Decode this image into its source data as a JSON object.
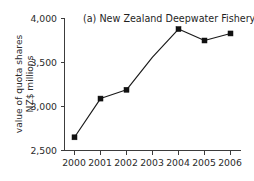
{
  "chart_data": {
    "type": "line",
    "title": "(a) New Zealand Deepwater Fishery",
    "xlabel": "",
    "ylabel_line1": "value of quota shares",
    "ylabel_line2": "NZ$ millions",
    "categories": [
      "2000",
      "2001",
      "2002",
      "2003",
      "2004",
      "2005",
      "2006"
    ],
    "x_tick_labels": [
      "2000",
      "2001",
      "2002",
      "2003",
      "2004",
      "2005",
      "2006"
    ],
    "y_tick_labels": [
      "2,500",
      "3,000",
      "3,500",
      "4,000"
    ],
    "y_tick_values": [
      2500,
      3000,
      3500,
      4000
    ],
    "ylim": [
      2500,
      4000
    ],
    "grid": false,
    "legend": false,
    "marker": "square",
    "series": [
      {
        "name": "value of quota shares",
        "points": [
          {
            "x": "2000",
            "y": 2650,
            "marker": true
          },
          {
            "x": "2001",
            "y": 3090,
            "marker": true
          },
          {
            "x": "2002",
            "y": 3190,
            "marker": true
          },
          {
            "x": "2003",
            "y": 3560,
            "marker": false
          },
          {
            "x": "2004",
            "y": 3880,
            "marker": true
          },
          {
            "x": "2005",
            "y": 3750,
            "marker": true
          },
          {
            "x": "2006",
            "y": 3830,
            "marker": true
          }
        ]
      }
    ]
  },
  "colors": {
    "line": "#1a1a1a",
    "marker": "#111111",
    "axis": "#3c3c3c",
    "text": "#2b2b2b",
    "background": "#ffffff"
  }
}
